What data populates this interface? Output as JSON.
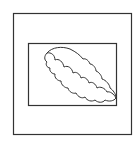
{
  "icon": {
    "name": "framed-cloud-picture-icon",
    "stroke_color": "#333333",
    "background": "#ffffff",
    "outer_frame": {
      "x": 13,
      "y": 13,
      "w": 118,
      "h": 121
    },
    "inner_frame": {
      "x": 28,
      "y": 43,
      "w": 88,
      "h": 62
    }
  }
}
